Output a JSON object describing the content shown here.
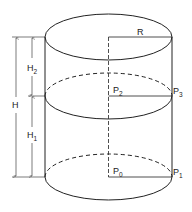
{
  "figure": {
    "type": "cylinder-dimension-diagram",
    "labels": {
      "R": "R",
      "H": "H",
      "H2": {
        "base": "H",
        "sub": "2"
      },
      "H1": {
        "base": "H",
        "sub": "1"
      },
      "P0": {
        "base": "P",
        "sub": "0"
      },
      "P1": {
        "base": "P",
        "sub": "1"
      },
      "P2": {
        "base": "P",
        "sub": "2"
      },
      "P3": {
        "base": "P",
        "sub": "3"
      }
    },
    "colors": {
      "stroke": "#222222",
      "background": "#ffffff"
    }
  }
}
